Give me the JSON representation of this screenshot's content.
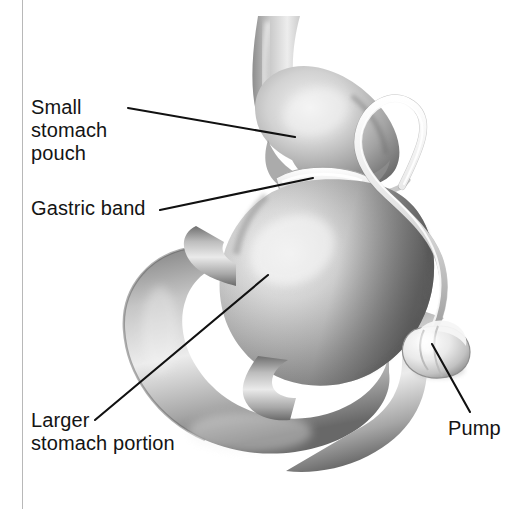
{
  "figure": {
    "background_color": "#ffffff",
    "border_rule_color": "#b8b8b8",
    "text_color": "#141414",
    "leader_line_color": "#111111"
  },
  "labels": {
    "small_stomach_pouch": "Small\nstomach\npouch",
    "gastric_band": "Gastric band",
    "larger_stomach_portion": "Larger\nstomach portion",
    "pump": "Pump"
  },
  "anatomy": {
    "esophagus": "esophagus",
    "small_pouch": "small-stomach-pouch",
    "band": "gastric-band",
    "stomach_body": "larger-stomach-portion",
    "duodenum": "duodenum",
    "tubing": "connecting-tube",
    "port": "access-port-pump"
  },
  "colors": {
    "tissue_light": "#ededed",
    "tissue_mid": "#b4b4b4",
    "tissue_dark": "#6a6a6a",
    "tissue_shadow": "#545454",
    "band_light": "#f2f2f2",
    "tube_light": "#e8e8e8",
    "tube_edge": "#9a9a9a",
    "pump_light": "#f0f0f0",
    "pump_edge": "#8f8f8f"
  },
  "leaders": [
    {
      "name": "pouch-leader",
      "from": [
        128,
        108
      ],
      "to": [
        295,
        137
      ]
    },
    {
      "name": "band-leader",
      "from": [
        160,
        210
      ],
      "to": [
        313,
        178
      ]
    },
    {
      "name": "larger-leader",
      "from": [
        95,
        420
      ],
      "to": [
        268,
        275
      ]
    },
    {
      "name": "pump-leader",
      "from": [
        470,
        412
      ],
      "to": [
        432,
        344
      ]
    }
  ]
}
